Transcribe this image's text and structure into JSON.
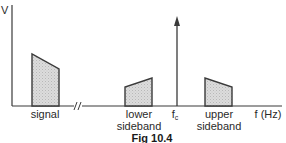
{
  "diagram": {
    "type": "frequency-spectrum",
    "y_axis_label": "V",
    "x_axis_label": "f (Hz)",
    "axis_break": "//",
    "carrier_label_main": "f",
    "carrier_label_sub": "c",
    "bands": [
      {
        "id": "signal",
        "label_line1": "signal",
        "label_line2": ""
      },
      {
        "id": "lower-sideband",
        "label_line1": "lower",
        "label_line2": "sideband"
      },
      {
        "id": "upper-sideband",
        "label_line1": "upper",
        "label_line2": "sideband"
      }
    ],
    "caption": "Fig 10.4",
    "colors": {
      "line": "#3a3a3a",
      "fill": "#d4d4d4",
      "background": "#ffffff"
    }
  }
}
